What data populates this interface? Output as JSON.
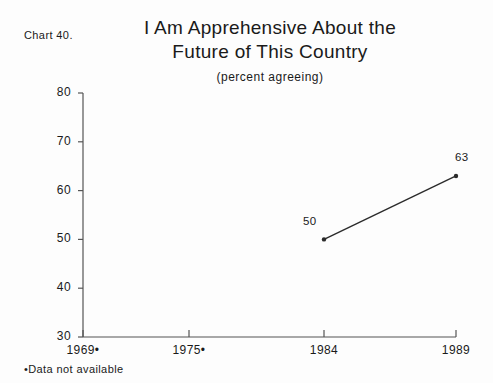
{
  "chart_label": "Chart 40.",
  "title_lines": [
    "I Am Apprehensive About the",
    "Future of This Country"
  ],
  "subtitle": "(percent agreeing)",
  "footnote": "•Data not available",
  "colors": {
    "ink": "#1a1a1a",
    "axis": "#555555",
    "background": "#fdfdfd",
    "line": "#2b2b2b"
  },
  "chart_data": {
    "type": "line",
    "title": "I Am Apprehensive About the Future of This Country",
    "subtitle": "(percent agreeing)",
    "xlabel": "",
    "ylabel": "",
    "categories": [
      "1969•",
      "1975•",
      "1984",
      "1989"
    ],
    "x_positions_px": [
      83,
      189,
      324,
      456
    ],
    "values": [
      null,
      null,
      50,
      63
    ],
    "point_labels": [
      "",
      "",
      "50",
      "63"
    ],
    "ylim": [
      30,
      80
    ],
    "yticks": [
      30,
      40,
      50,
      60,
      70,
      80
    ],
    "ytick_labels": [
      "30",
      "40",
      "50",
      "60",
      "70",
      "80"
    ],
    "grid": false,
    "legend": "none",
    "missing_data_note": "•Data not available",
    "series": [
      {
        "name": "percent agreeing",
        "points": [
          {
            "x": "1984",
            "y": 50
          },
          {
            "x": "1989",
            "y": 63
          }
        ]
      }
    ]
  }
}
